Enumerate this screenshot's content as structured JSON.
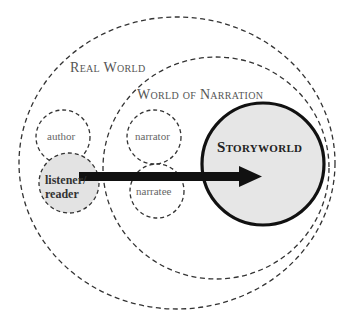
{
  "diagram": {
    "regions": {
      "real_world": {
        "label": "Real World"
      },
      "world_of_narration": {
        "label": "World of Narration"
      },
      "storyworld": {
        "label": "Storyworld",
        "fill": "#e6e6e6"
      }
    },
    "nodes": {
      "author": {
        "label": "author"
      },
      "narrator": {
        "label": "narrator"
      },
      "listener_reader": {
        "label_line1": "listener/",
        "label_line2": "reader",
        "fill": "#e3e3e3"
      },
      "narratee": {
        "label": "narratee"
      }
    },
    "edges": [
      {
        "from": "listener/reader",
        "to": "Storyworld",
        "style": "thick-arrow"
      }
    ]
  }
}
